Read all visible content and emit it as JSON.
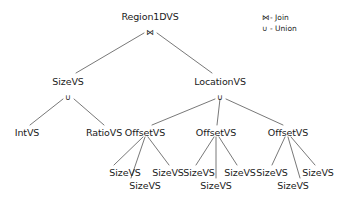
{
  "diagram": {
    "type": "value-space-decomposition-tree",
    "background_color": "#ffffff",
    "text_color": "#1a1a1a",
    "edge_color": "#555555"
  },
  "symbols": {
    "join": "⋈",
    "union": "∪"
  },
  "nodes": {
    "root": {
      "label": "Region1DVS",
      "operator": "⋈",
      "x": 150,
      "y": 17,
      "op_x": 150,
      "op_y": 32
    },
    "size_vs": {
      "label": "SizeVS",
      "operator": "∪",
      "x": 68,
      "y": 82,
      "op_x": 68,
      "op_y": 97
    },
    "location_vs": {
      "label": "LocationVS",
      "operator": "∪",
      "x": 220,
      "y": 82,
      "op_x": 220,
      "op_y": 97
    },
    "int_vs": {
      "label": "IntVS",
      "x": 27,
      "y": 133
    },
    "ratio_vs": {
      "label": "RatioVS",
      "x": 104,
      "y": 133
    },
    "offset_vs_1": {
      "label": "OffsetVS",
      "x": 145,
      "y": 133
    },
    "offset_vs_2": {
      "label": "OffsetVS",
      "x": 216,
      "y": 133
    },
    "offset_vs_3": {
      "label": "OffsetVS",
      "x": 288,
      "y": 133
    },
    "leaf_1a": {
      "label": "SizeVS",
      "x": 125,
      "y": 173
    },
    "leaf_1b": {
      "label": "SizeVS",
      "x": 168,
      "y": 173
    },
    "leaf_1c": {
      "label": "SizeVS",
      "x": 145,
      "y": 186
    },
    "leaf_2a": {
      "label": "SizeVS",
      "x": 199,
      "y": 173
    },
    "leaf_2b": {
      "label": "SizeVS",
      "x": 240,
      "y": 173
    },
    "leaf_2c": {
      "label": "SizeVS",
      "x": 216,
      "y": 186
    },
    "leaf_3a": {
      "label": "SizeVS",
      "x": 272,
      "y": 173
    },
    "leaf_3b": {
      "label": "SizeVS",
      "x": 318,
      "y": 173
    },
    "leaf_3c": {
      "label": "SizeVS",
      "x": 293,
      "y": 186
    }
  },
  "legend": {
    "x": 262,
    "y": 13,
    "entries": [
      {
        "symbol": "⋈",
        "separator": "-",
        "label": "Join"
      },
      {
        "symbol": "∪",
        "separator": "-",
        "label": "Union"
      }
    ]
  },
  "edges": [
    {
      "from": "root",
      "to": "size_vs"
    },
    {
      "from": "root",
      "to": "location_vs"
    },
    {
      "from": "size_vs",
      "to": "int_vs"
    },
    {
      "from": "size_vs",
      "to": "ratio_vs"
    },
    {
      "from": "location_vs",
      "to": "offset_vs_1"
    },
    {
      "from": "location_vs",
      "to": "offset_vs_2"
    },
    {
      "from": "location_vs",
      "to": "offset_vs_3"
    },
    {
      "from": "offset_vs_1",
      "to": "leaf_1a"
    },
    {
      "from": "offset_vs_1",
      "to": "leaf_1b"
    },
    {
      "from": "offset_vs_1",
      "to": "leaf_1c"
    },
    {
      "from": "offset_vs_2",
      "to": "leaf_2a"
    },
    {
      "from": "offset_vs_2",
      "to": "leaf_2b"
    },
    {
      "from": "offset_vs_2",
      "to": "leaf_2c"
    },
    {
      "from": "offset_vs_3",
      "to": "leaf_3a"
    },
    {
      "from": "offset_vs_3",
      "to": "leaf_3b"
    },
    {
      "from": "offset_vs_3",
      "to": "leaf_3c"
    }
  ]
}
